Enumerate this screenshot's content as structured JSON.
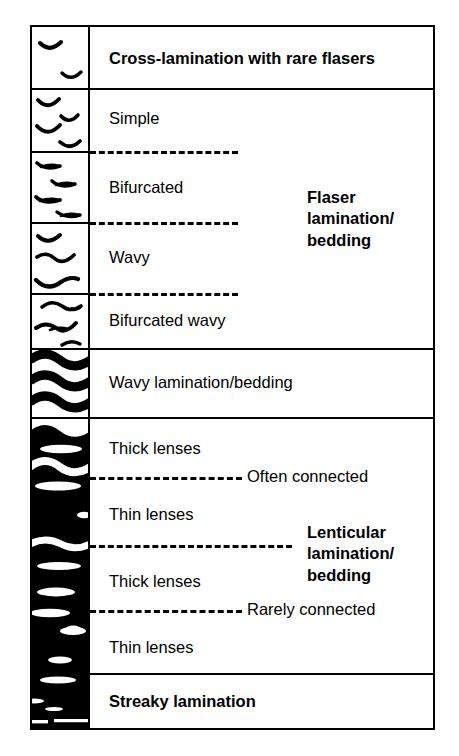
{
  "diagram": {
    "frame_color": "#000000",
    "background_color": "#ffffff",
    "ink_color": "#000000"
  },
  "rows": [
    {
      "id": "cross-lamination",
      "label": "Cross-lamination with rare flasers",
      "weight": "bold",
      "symbol": "sparse-flaser-arcs"
    },
    {
      "id": "simple-flaser",
      "label": "Simple",
      "weight": "normal",
      "symbol": "simple-flaser-arcs"
    },
    {
      "id": "bifurcated-flaser",
      "label": "Bifurcated",
      "weight": "normal",
      "symbol": "bifurcated-flaser-arcs"
    },
    {
      "id": "wavy-flaser",
      "label": "Wavy",
      "weight": "normal",
      "symbol": "wavy-flaser-arcs"
    },
    {
      "id": "bifurcated-wavy-flaser",
      "label": "Bifurcated wavy",
      "weight": "normal",
      "symbol": "bifurcated-wavy-flaser-arcs"
    },
    {
      "id": "wavy-lamination",
      "label": "Wavy lamination/bedding",
      "weight": "normal",
      "symbol": "wavy-bands"
    },
    {
      "id": "thick-lenses-1",
      "label": "Thick lenses",
      "weight": "normal",
      "symbol": "thick-lenses-connected"
    },
    {
      "id": "thin-lenses-1",
      "label": "Thin lenses",
      "weight": "normal",
      "symbol": "thin-lenses-connected"
    },
    {
      "id": "thick-lenses-2",
      "label": "Thick lenses",
      "weight": "normal",
      "symbol": "thick-lenses-isolated"
    },
    {
      "id": "thin-lenses-2",
      "label": "Thin lenses",
      "weight": "normal",
      "symbol": "thin-lenses-isolated"
    },
    {
      "id": "streaky-lamination",
      "label": "Streaky lamination",
      "weight": "bold",
      "symbol": "streaks"
    }
  ],
  "groups": [
    {
      "id": "flaser-group",
      "label": "Flaser lamination/ bedding",
      "lines": [
        "Flaser",
        "lamination/",
        "bedding"
      ]
    },
    {
      "id": "lenticular-group",
      "label": "Lenticular lamination/ bedding",
      "lines": [
        "Lenticular",
        "lamination/",
        "bedding"
      ]
    }
  ],
  "dash_notes": [
    {
      "id": "often-connected",
      "label": "Often connected"
    },
    {
      "id": "rarely-connected",
      "label": "Rarely connected"
    }
  ],
  "group_text": {
    "flaser_line1": "Flaser",
    "flaser_line2": "lamination/",
    "flaser_line3": "bedding",
    "lenticular_line1": "Lenticular",
    "lenticular_line2": "lamination/",
    "lenticular_line3": "bedding"
  }
}
